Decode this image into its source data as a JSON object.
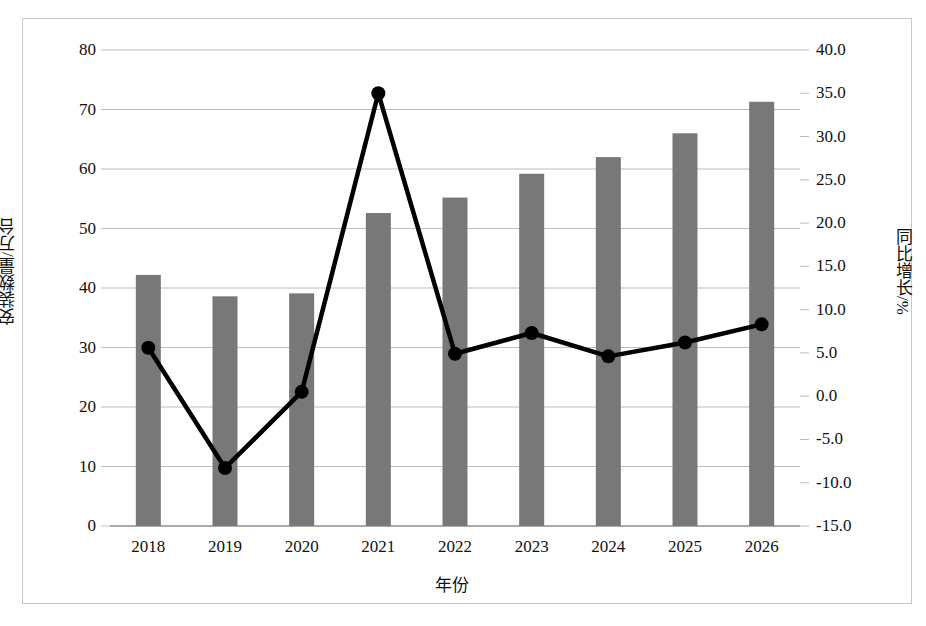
{
  "chart_data": {
    "type": "bar",
    "title": "",
    "xlabel": "年份",
    "ylabel": "安装数量/万台",
    "y2label": "同比增长/%",
    "categories": [
      "2018",
      "2019",
      "2020",
      "2021",
      "2022",
      "2023",
      "2024",
      "2025",
      "2026"
    ],
    "ylim": [
      0,
      80
    ],
    "y2lim": [
      -15.0,
      40.0
    ],
    "yticks": [
      "0",
      "10",
      "20",
      "30",
      "40",
      "50",
      "60",
      "70",
      "80"
    ],
    "ytick_values": [
      0,
      10,
      20,
      30,
      40,
      50,
      60,
      70,
      80
    ],
    "y2ticks": [
      "-15.0",
      "-10.0",
      "-5.0",
      "0.0",
      "5.0",
      "10.0",
      "15.0",
      "20.0",
      "25.0",
      "30.0",
      "35.0",
      "40.0"
    ],
    "y2tick_values": [
      -15.0,
      -10.0,
      -5.0,
      0.0,
      5.0,
      10.0,
      15.0,
      20.0,
      25.0,
      30.0,
      35.0,
      40.0
    ],
    "grid": true,
    "legend": "none",
    "series": [
      {
        "name": "安装数量/万台",
        "type": "bar",
        "axis": "left",
        "color": "#787878",
        "values": [
          42.2,
          38.6,
          39.1,
          52.6,
          55.2,
          59.2,
          62.0,
          66.0,
          71.3
        ]
      },
      {
        "name": "同比增长/%",
        "type": "line",
        "axis": "right",
        "color": "#000000",
        "marker": "circle",
        "values": [
          5.6,
          -8.3,
          0.5,
          35.0,
          4.9,
          7.3,
          4.6,
          6.2,
          8.3
        ]
      }
    ]
  }
}
